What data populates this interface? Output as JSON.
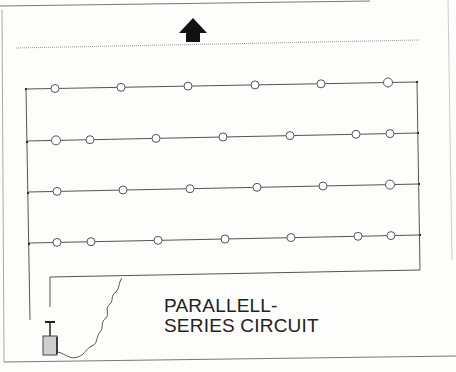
{
  "diagram": {
    "title_line1": "PARALLELL-",
    "title_line2": "SERIES CIRCUIT",
    "direction_indicator": "up-arrow-icon",
    "colors": {
      "wire": "#555555",
      "bulb_stroke": "#555555",
      "bulb_fill": "#ffffff",
      "battery_fill": "#cfcfcf",
      "arrow": "#111111",
      "border": "#888888"
    },
    "rows": [
      {
        "label": "branch-1",
        "bulb_count": 6
      },
      {
        "label": "branch-2",
        "bulb_count": 7
      },
      {
        "label": "branch-3",
        "bulb_count": 6
      },
      {
        "label": "branch-4",
        "bulb_count": 7
      }
    ],
    "components": [
      "plunger-detonator",
      "lead-wire",
      "parallel-bus-left",
      "parallel-bus-right",
      "return-wire"
    ]
  }
}
